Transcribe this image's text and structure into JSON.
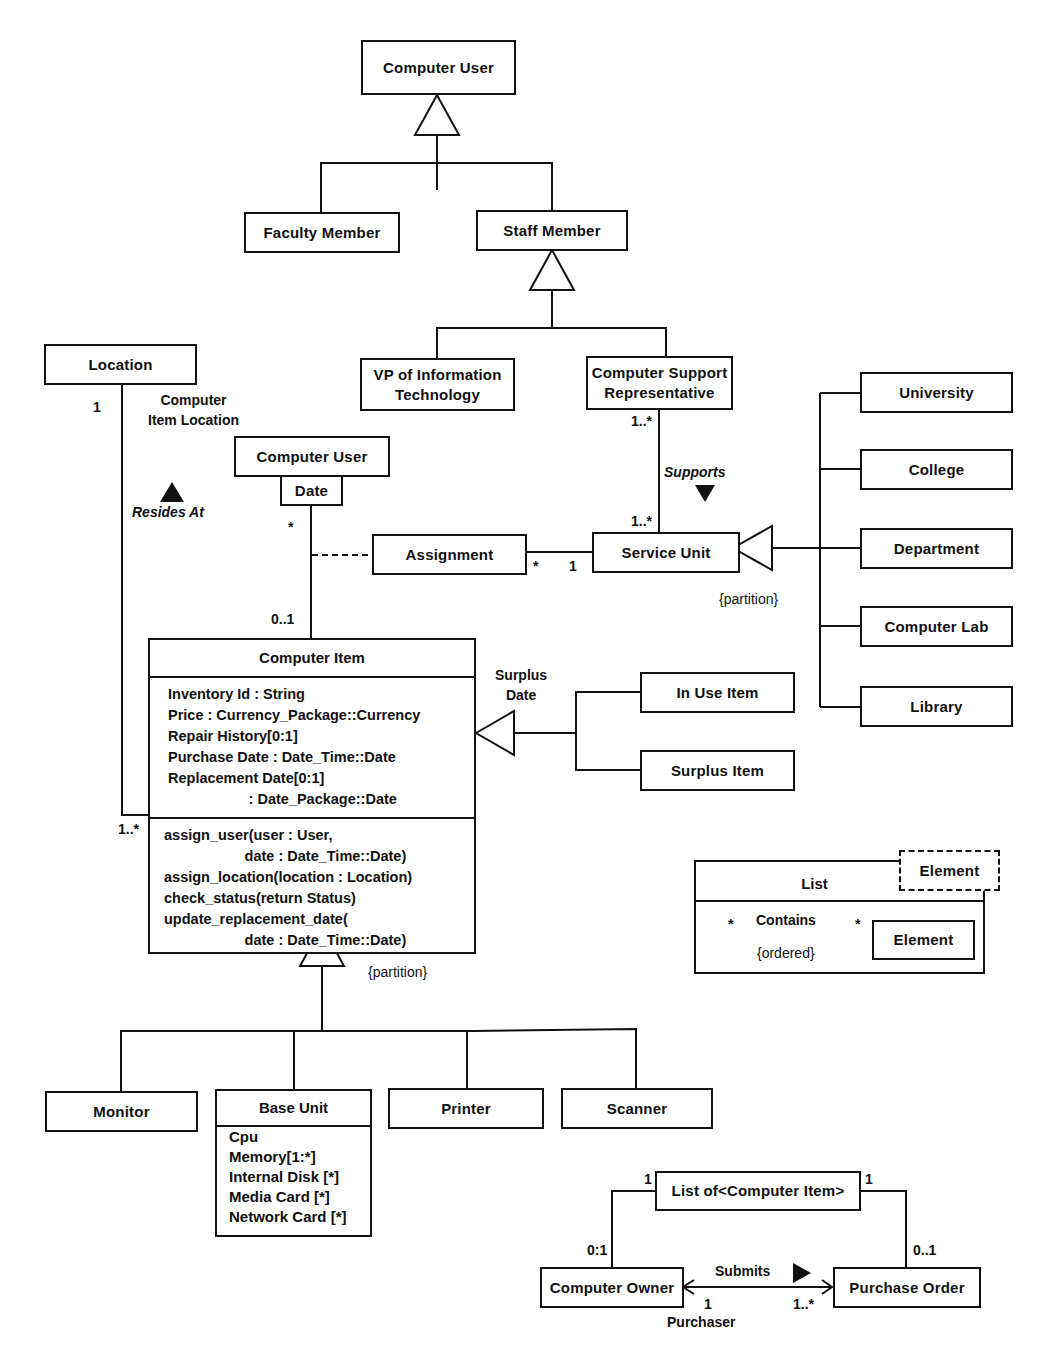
{
  "diagram": {
    "type": "uml-class-diagram",
    "classes": {
      "computer_user_top": "Computer User",
      "faculty_member": "Faculty Member",
      "staff_member": "Staff Member",
      "vp_it": "VP of Information\nTechnology",
      "csr": "Computer Support\nRepresentative",
      "location": "Location",
      "computer_user_qualified": "Computer User",
      "date_qualifier": "Date",
      "assignment": "Assignment",
      "service_unit": "Service Unit",
      "university": "University",
      "college": "College",
      "department": "Department",
      "computer_lab": "Computer Lab",
      "library": "Library",
      "in_use_item": "In Use Item",
      "surplus_item": "Surplus Item",
      "monitor": "Monitor",
      "printer": "Printer",
      "scanner": "Scanner",
      "list_of_computer_item": "List of<Computer Item>",
      "computer_owner": "Computer Owner",
      "purchase_order": "Purchase Order"
    },
    "computer_item": {
      "name": "Computer Item",
      "attributes": [
        "Inventory Id : String",
        "Price : Currency_Package::Currency",
        "Repair History[0:1]",
        "Purchase Date : Date_Time::Date",
        "Replacement Date[0:1]",
        "                    : Date_Package::Date"
      ],
      "operations": [
        "assign_user(user : User,",
        "                    date : Date_Time::Date)",
        "assign_location(location : Location)",
        "check_status(return Status)",
        "update_replacement_date(",
        "                    date : Date_Time::Date)"
      ]
    },
    "base_unit": {
      "name": "Base Unit",
      "attributes": [
        "Cpu",
        "Memory[1:*]",
        "Internal Disk [*]",
        "Media Card [*]",
        "Network Card [*]"
      ]
    },
    "list_template": {
      "name": "List",
      "parameter": "Element",
      "inner_class": "Element",
      "association": "Contains",
      "constraint": "{ordered}",
      "mult_left": "*",
      "mult_right": "*"
    },
    "labels": {
      "loc_mult": "1",
      "assoc_computer_item_location": "Computer\nItem Location",
      "resides_at": "Resides At",
      "user_mult_star": "*",
      "user_mult_01": "0..1",
      "ci_loc_mult": "1..*",
      "csr_mult": "1..*",
      "supports": "Supports",
      "su_mult": "1..*",
      "assign_mult_star": "*",
      "assign_mult_1": "1",
      "partition_service": "{partition}",
      "surplus_date": "Surplus\nDate",
      "partition_items": "{partition}",
      "list_mult_left": "1",
      "list_mult_right": "1",
      "owner_mult": "0:1",
      "po_mult": "0..1",
      "submits": "Submits",
      "submits_mult_1": "1",
      "submits_mult_many": "1..*",
      "purchaser": "Purchaser"
    },
    "colors": {
      "ink": "#111111",
      "background": "#ffffff"
    }
  }
}
